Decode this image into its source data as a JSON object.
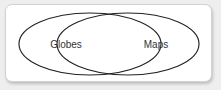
{
  "canvas": {
    "width": 221,
    "height": 90,
    "background_color": "#eeeeee"
  },
  "card": {
    "background_color": "#ffffff",
    "border_color": "#d2d2d2",
    "corner_radius": 7,
    "shadow": "soft drop shadow bottom-right"
  },
  "diagram": {
    "type": "venn",
    "set_count": 2,
    "stroke_color": "#222222",
    "stroke_width": 1.15,
    "fill": "none",
    "label_color": "#333333",
    "label_font_size": 10,
    "sets": [
      {
        "id": "globes",
        "label": "Globes",
        "side": "left",
        "cx": 84,
        "cy": 39,
        "rx": 71,
        "ry": 31,
        "label_x": 60,
        "label_y": 39
      },
      {
        "id": "maps",
        "label": "Maps",
        "side": "right",
        "cx": 122,
        "cy": 39,
        "rx": 71,
        "ry": 31,
        "label_x": 150,
        "label_y": 39
      }
    ],
    "intersection": {
      "label": "",
      "center_x": 103,
      "center_y": 39,
      "shape": "lens"
    }
  }
}
